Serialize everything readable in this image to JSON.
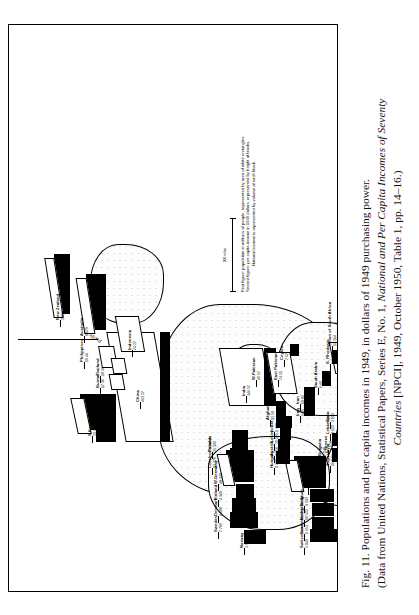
{
  "figure": {
    "number": "Fig. 11.",
    "caption_line1": "Populations and per capita incomes in 1949, in dollars of 1949 purchasing power.",
    "caption_line2": "(Data from United Nations, Statistical Papers, Series E, No. 1, National and Per Capita Incomes of Seventy",
    "caption_line3": "Countries [NPCI], 1949, October 1950, Table 1, pp. 14–16.)",
    "caption_italic_1": "National and Per Capita Incomes of Seventy",
    "caption_italic_2": "Countries"
  },
  "legend": {
    "line1_key": "First figure:",
    "line1_text": "population in millions of people, represented by area of white rectangles.",
    "line2_key": "Second figure:",
    "line2_text": "per capita income in 1949 dollars, represented by height of blocks.",
    "line3_text": "National income is represented by volume of each block.",
    "scale_label": "500 miles"
  },
  "ocean_labels": [
    {
      "name": "Pacific",
      "text": "Pacific"
    },
    {
      "name": "Equator",
      "text": "Equator"
    }
  ],
  "chart_data": {
    "type": "bar",
    "title": "Populations and per capita incomes in 1949",
    "xlabel": "Country (placed on world map)",
    "ylabel": "Per capita income (1949 dollars) — block height",
    "columns": [
      "country",
      "population_millions",
      "per_capita_income_usd"
    ],
    "rows": [
      {
        "country": "U.S.",
        "population_millions": 149,
        "per_capita_income_usd": 1453
      },
      {
        "country": "Canada",
        "population_millions": 14,
        "per_capita_income_usd": 870
      },
      {
        "country": "Mexico",
        "population_millions": 25,
        "per_capita_income_usd": 200
      },
      {
        "country": "Guatemala",
        "population_millions": 2,
        "per_capita_income_usd": 77
      },
      {
        "country": "El Salvador",
        "population_millions": 2,
        "per_capita_income_usd": 118
      },
      {
        "country": "Honduras",
        "population_millions": 1,
        "per_capita_income_usd": 83
      },
      {
        "country": "Costa Rica",
        "population_millions": 1,
        "per_capita_income_usd": 125
      },
      {
        "country": "Panama",
        "population_millions": 1,
        "per_capita_income_usd": 208
      },
      {
        "country": "Cuba",
        "population_millions": 5,
        "per_capita_income_usd": 288
      },
      {
        "country": "Haiti",
        "population_millions": 4,
        "per_capita_income_usd": 42
      },
      {
        "country": "Dominican Republic",
        "population_millions": 2,
        "per_capita_income_usd": 119
      },
      {
        "country": "Venezuela",
        "population_millions": 5,
        "per_capita_income_usd": 302
      },
      {
        "country": "Colombia",
        "population_millions": 11,
        "per_capita_income_usd": 132
      },
      {
        "country": "Ecuador",
        "population_millions": 3,
        "per_capita_income_usd": 48
      },
      {
        "country": "Peru",
        "population_millions": 8,
        "per_capita_income_usd": 100
      },
      {
        "country": "Brazil",
        "population_millions": 49,
        "per_capita_income_usd": 112
      },
      {
        "country": "Bolivia",
        "population_millions": 4,
        "per_capita_income_usd": 55
      },
      {
        "country": "Paraguay",
        "population_millions": 1,
        "per_capita_income_usd": 84
      },
      {
        "country": "Uruguay",
        "population_millions": 2,
        "per_capita_income_usd": 331
      },
      {
        "country": "Argentina",
        "population_millions": 17,
        "per_capita_income_usd": 346
      },
      {
        "country": "Chile",
        "population_millions": 6,
        "per_capita_income_usd": 188
      },
      {
        "country": "Norway",
        "population_millions": 3,
        "per_capita_income_usd": 587
      },
      {
        "country": "Sweden",
        "population_millions": 7,
        "per_capita_income_usd": 780
      },
      {
        "country": "Denmark",
        "population_millions": 4,
        "per_capita_income_usd": 689
      },
      {
        "country": "Finland",
        "population_millions": 4,
        "per_capita_income_usd": 349
      },
      {
        "country": "W. Germany",
        "population_millions": 48,
        "per_capita_income_usd": 320
      },
      {
        "country": "Czechoslovakia",
        "population_millions": 12,
        "per_capita_income_usd": 370
      },
      {
        "country": "Poland",
        "population_millions": 25,
        "per_capita_income_usd": 300
      },
      {
        "country": "Switzerland",
        "population_millions": 5,
        "per_capita_income_usd": 849
      },
      {
        "country": "Luxembourg",
        "population_millions": 1,
        "per_capita_income_usd": 553
      },
      {
        "country": "Netherlands",
        "population_millions": 10,
        "per_capita_income_usd": 502
      },
      {
        "country": "Belgium",
        "population_millions": 9,
        "per_capita_income_usd": 582
      },
      {
        "country": "U.K.",
        "population_millions": 50,
        "per_capita_income_usd": 773
      },
      {
        "country": "Ireland",
        "population_millions": 3,
        "per_capita_income_usd": 420
      },
      {
        "country": "Hungary",
        "population_millions": 9,
        "per_capita_income_usd": 269
      },
      {
        "country": "Austria",
        "population_millions": 7,
        "per_capita_income_usd": 216
      },
      {
        "country": "Turkey",
        "population_millions": 20,
        "per_capita_income_usd": 125
      },
      {
        "country": "Israel",
        "population_millions": 1,
        "per_capita_income_usd": 389
      },
      {
        "country": "Afghanistan",
        "population_millions": 12,
        "per_capita_income_usd": 50
      },
      {
        "country": "Yugoslavia",
        "population_millions": 16,
        "per_capita_income_usd": 146
      },
      {
        "country": "Greece",
        "population_millions": 8,
        "per_capita_income_usd": 128
      },
      {
        "country": "Bulgaria",
        "population_millions": 7,
        "per_capita_income_usd": 140
      },
      {
        "country": "Lebanon",
        "population_millions": 1,
        "per_capita_income_usd": 125
      },
      {
        "country": "Syria",
        "population_millions": 3,
        "per_capita_income_usd": 100
      },
      {
        "country": "Iraq",
        "population_millions": 5,
        "per_capita_income_usd": 85
      },
      {
        "country": "Iran",
        "population_millions": 19,
        "per_capita_income_usd": 85
      },
      {
        "country": "Saudi Arabia",
        "population_millions": 6,
        "per_capita_income_usd": 40
      },
      {
        "country": "Yemen",
        "population_millions": 4,
        "per_capita_income_usd": 40
      },
      {
        "country": "Ethiopia",
        "population_millions": 15,
        "per_capita_income_usd": 38
      },
      {
        "country": "Union of South Africa",
        "population_millions": 12,
        "per_capita_income_usd": 264
      },
      {
        "country": "S. Rhodesia",
        "population_millions": 2,
        "per_capita_income_usd": 161
      },
      {
        "country": "India",
        "population_millions": 346,
        "per_capita_income_usd": 57
      },
      {
        "country": "W. Pakistan",
        "population_millions": 40,
        "per_capita_income_usd": 57
      },
      {
        "country": "East Pakistan",
        "population_millions": 74,
        "per_capita_income_usd": 51
      },
      {
        "country": "Ceylon",
        "population_millions": 7,
        "per_capita_income_usd": 67
      },
      {
        "country": "China",
        "population_millions": 463,
        "per_capita_income_usd": 27
      },
      {
        "country": "Japan",
        "population_millions": 81,
        "per_capita_income_usd": 100
      },
      {
        "country": "S. Korea",
        "population_millions": 20,
        "per_capita_income_usd": 49
      },
      {
        "country": "Burma",
        "population_millions": 17,
        "per_capita_income_usd": 36
      },
      {
        "country": "Thailand",
        "population_millions": 18,
        "per_capita_income_usd": 36
      },
      {
        "country": "Philippines",
        "population_millions": 19,
        "per_capita_income_usd": 44
      },
      {
        "country": "Indonesia",
        "population_millions": 74,
        "per_capita_income_usd": 27
      },
      {
        "country": "Australia",
        "population_millions": 8,
        "per_capita_income_usd": 679
      },
      {
        "country": "New Zealand",
        "population_millions": 2,
        "per_capita_income_usd": 856
      }
    ]
  },
  "map_labels": [
    {
      "name": "norway",
      "text": "Norway",
      "fig": "3·587",
      "x": 44,
      "y": 232,
      "rot": 0
    },
    {
      "name": "sweden",
      "text": "Sweden",
      "fig": "7·780",
      "x": 60,
      "y": 206,
      "rot": 0
    },
    {
      "name": "denmark",
      "text": "Denmark",
      "fig": "4·689",
      "x": 76,
      "y": 206,
      "rot": 0
    },
    {
      "name": "finland",
      "text": "Finland",
      "fig": "4·349",
      "x": 92,
      "y": 206,
      "rot": 0
    },
    {
      "name": "w-germany",
      "text": "W.Germany",
      "fig": "48·320",
      "x": 108,
      "y": 206,
      "rot": 0
    },
    {
      "name": "czechoslovakia",
      "text": "Czechoslovakia",
      "fig": "12·370",
      "x": 124,
      "y": 200,
      "rot": 0
    },
    {
      "name": "poland",
      "text": "Poland",
      "fig": "25·300",
      "x": 140,
      "y": 200,
      "rot": 0
    },
    {
      "name": "switzerland",
      "text": "Switzerland",
      "fig": "5·849",
      "x": 44,
      "y": 292,
      "rot": 0
    },
    {
      "name": "luxembourg",
      "text": "Luxembourg",
      "fig": "1·553",
      "x": 58,
      "y": 292,
      "rot": 0
    },
    {
      "name": "netherlands",
      "text": "Netherlands",
      "fig": "10·502",
      "x": 72,
      "y": 292,
      "rot": 0
    },
    {
      "name": "belgium",
      "text": "Belgium",
      "fig": "9·582",
      "x": 86,
      "y": 292,
      "rot": 0
    },
    {
      "name": "uk",
      "text": "U.K.",
      "fig": "50·773",
      "x": 104,
      "y": 296,
      "rot": 0
    },
    {
      "name": "ireland",
      "text": "Ireland",
      "fig": "3·420",
      "x": 76,
      "y": 344,
      "rot": 0
    },
    {
      "name": "canada",
      "text": "Canada",
      "fig": "14·870",
      "x": 48,
      "y": 392,
      "rot": 0
    },
    {
      "name": "us",
      "text": "U.S.",
      "fig": "149·1453",
      "x": 56,
      "y": 436,
      "rot": 0
    },
    {
      "name": "mexico",
      "text": "Mexico",
      "fig": "25·200",
      "x": 130,
      "y": 470,
      "rot": 0
    },
    {
      "name": "guatemala",
      "text": "Guatemala",
      "fig": "2·77",
      "x": 152,
      "y": 480,
      "rot": 0
    },
    {
      "name": "el-salvador",
      "text": "El Salvador",
      "fig": "2·118",
      "x": 164,
      "y": 480,
      "rot": 0
    },
    {
      "name": "honduras",
      "text": "Honduras",
      "fig": "1·83",
      "x": 176,
      "y": 486,
      "rot": 0
    },
    {
      "name": "costa-rica",
      "text": "Costa Rica",
      "fig": "1·125",
      "x": 188,
      "y": 490,
      "rot": 0
    },
    {
      "name": "panama",
      "text": "Panama",
      "fig": "1·208",
      "x": 200,
      "y": 496,
      "rot": 0
    },
    {
      "name": "cuba",
      "text": "Cuba",
      "fig": "5·288",
      "x": 124,
      "y": 430,
      "rot": 0
    },
    {
      "name": "haiti",
      "text": "Haiti",
      "fig": "4·42",
      "x": 154,
      "y": 430,
      "rot": 0
    },
    {
      "name": "dominican",
      "text": "Dominican Republic",
      "fig": "2·119",
      "x": 138,
      "y": 418,
      "rot": 0
    },
    {
      "name": "venezuela",
      "text": "Venezuela",
      "fig": "5·302",
      "x": 154,
      "y": 400,
      "rot": 0
    },
    {
      "name": "colombia",
      "text": "Colombia",
      "fig": "11·132",
      "x": 168,
      "y": 400,
      "rot": 0
    },
    {
      "name": "ecuador",
      "text": "Ecuador",
      "fig": "3·48",
      "x": 208,
      "y": 472,
      "rot": 0
    },
    {
      "name": "peru",
      "text": "Peru",
      "fig": "8·100",
      "x": 220,
      "y": 472,
      "rot": 0
    },
    {
      "name": "brazil",
      "text": "Brazil",
      "fig": "49·112",
      "x": 188,
      "y": 396,
      "rot": 0
    },
    {
      "name": "bolivia",
      "text": "Bolivia",
      "fig": "4·55",
      "x": 216,
      "y": 388,
      "rot": 0
    },
    {
      "name": "paraguay",
      "text": "Paraguay",
      "fig": "1·84",
      "x": 202,
      "y": 388,
      "rot": 0
    },
    {
      "name": "uruguay",
      "text": "Uruguay",
      "fig": "2·331",
      "x": 230,
      "y": 388,
      "rot": 0
    },
    {
      "name": "argentina",
      "text": "Argentina",
      "fig": "17·346",
      "x": 244,
      "y": 388,
      "rot": 0
    },
    {
      "name": "chile",
      "text": "Chile",
      "fig": "6·188",
      "x": 264,
      "y": 446,
      "rot": 0
    },
    {
      "name": "hungary",
      "text": "Hungary",
      "fig": "9·269",
      "x": 124,
      "y": 262,
      "rot": 0
    },
    {
      "name": "austria",
      "text": "Austria",
      "fig": "7·216",
      "x": 136,
      "y": 262,
      "rot": 0
    },
    {
      "name": "turkey",
      "text": "Turkey",
      "fig": "20·125",
      "x": 148,
      "y": 262,
      "rot": 0
    },
    {
      "name": "israel",
      "text": "Israel",
      "fig": "1·389",
      "x": 160,
      "y": 262,
      "rot": 0
    },
    {
      "name": "afghanistan",
      "text": "Afghanistan",
      "fig": "12·50",
      "x": 172,
      "y": 258,
      "rot": 0
    },
    {
      "name": "yugoslavia",
      "text": "Yugoslavia",
      "fig": "16·146",
      "x": 126,
      "y": 318,
      "rot": 0
    },
    {
      "name": "greece",
      "text": "Greece",
      "fig": "8·128",
      "x": 142,
      "y": 316,
      "rot": 0
    },
    {
      "name": "bulgaria",
      "text": "Bulgaria",
      "fig": "7·140",
      "x": 136,
      "y": 310,
      "rot": 0
    },
    {
      "name": "lebanon",
      "text": "Lebanon",
      "fig": "1·125",
      "x": 158,
      "y": 318,
      "rot": 0
    },
    {
      "name": "syria",
      "text": "Syria",
      "fig": "3·100",
      "x": 170,
      "y": 318,
      "rot": 0
    },
    {
      "name": "iraq",
      "text": "Iraq",
      "fig": "5·85",
      "x": 176,
      "y": 288,
      "rot": 0
    },
    {
      "name": "iran",
      "text": "Iran",
      "fig": "19·85",
      "x": 188,
      "y": 288,
      "rot": 0
    },
    {
      "name": "saudi-arabia",
      "text": "Saudi Arabia",
      "fig": "6·40",
      "x": 204,
      "y": 306,
      "rot": 0
    },
    {
      "name": "yemen",
      "text": "Yemen",
      "fig": "4·40",
      "x": 196,
      "y": 330,
      "rot": 0
    },
    {
      "name": "ethiopia",
      "text": "Ethiopia",
      "fig": "15·38",
      "x": 186,
      "y": 350,
      "rot": 0
    },
    {
      "name": "south-africa",
      "text": "Union of South Africa",
      "fig": "12·264",
      "x": 246,
      "y": 320,
      "rot": 0
    },
    {
      "name": "s-rhodesia",
      "text": "S. Rhodesia",
      "fig": "2·161",
      "x": 228,
      "y": 318,
      "rot": 0
    },
    {
      "name": "india",
      "text": "India",
      "fig": "346·57",
      "x": 196,
      "y": 234,
      "rot": 0
    },
    {
      "name": "w-pakistan",
      "text": "W.Pakistan",
      "fig": "40·57",
      "x": 212,
      "y": 244,
      "rot": 0
    },
    {
      "name": "east-pakistan",
      "text": "East Pakistan",
      "fig": "74·51",
      "x": 212,
      "y": 266,
      "rot": 0
    },
    {
      "name": "ceylon",
      "text": "Ceylon",
      "fig": "7·67",
      "x": 232,
      "y": 272,
      "rot": 0
    },
    {
      "name": "china",
      "text": "China",
      "fig": "463·27",
      "x": 190,
      "y": 128,
      "rot": 0
    },
    {
      "name": "japan",
      "text": "Japan",
      "fig": "81·100",
      "x": 170,
      "y": 80,
      "rot": 0
    },
    {
      "name": "s-korea",
      "text": "S.Korea",
      "fig": "20·49",
      "x": 156,
      "y": 80,
      "rot": 0
    },
    {
      "name": "burma",
      "text": "Burma",
      "fig": "17·36",
      "x": 204,
      "y": 88,
      "rot": 0
    },
    {
      "name": "thailand",
      "text": "Thailand",
      "fig": "18·36",
      "x": 216,
      "y": 88,
      "rot": 0
    },
    {
      "name": "philippines",
      "text": "Philippines",
      "fig": "19·44",
      "x": 230,
      "y": 72,
      "rot": 0
    },
    {
      "name": "indonesia",
      "text": "Indonesia",
      "fig": "74·27",
      "x": 242,
      "y": 120,
      "rot": 0
    },
    {
      "name": "australia",
      "text": "Australia",
      "fig": "8·679",
      "x": 256,
      "y": 72,
      "rot": 0
    },
    {
      "name": "new-zealand",
      "text": "New Zealand",
      "fig": "2·856",
      "x": 272,
      "y": 48,
      "rot": 0
    }
  ]
}
